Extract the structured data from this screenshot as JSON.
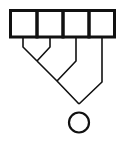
{
  "diagram": {
    "type": "reduction-tree",
    "colors": {
      "stroke": "#111111",
      "background": "#ffffff"
    },
    "cells": [
      {
        "index": 0,
        "label": ""
      },
      {
        "index": 1,
        "label": ""
      },
      {
        "index": 2,
        "label": ""
      },
      {
        "index": 3,
        "label": ""
      }
    ],
    "merges": [
      {
        "inputs": [
          "cell-0",
          "cell-1"
        ],
        "output": "merge-1"
      },
      {
        "inputs": [
          "merge-1",
          "cell-2"
        ],
        "output": "merge-2"
      },
      {
        "inputs": [
          "merge-2",
          "cell-3"
        ],
        "output": "result"
      }
    ],
    "result": {
      "shape": "circle",
      "label": ""
    }
  }
}
